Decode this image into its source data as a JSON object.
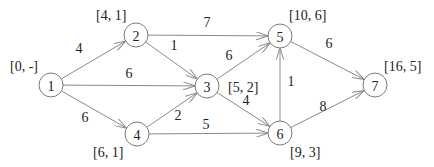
{
  "diagram": {
    "type": "directed-weighted-graph",
    "nodes": [
      {
        "id": "1",
        "x": 51,
        "y": 85,
        "tag": "[0, -]",
        "tag_x": 10,
        "tag_y": 66,
        "tag_anchor": "start"
      },
      {
        "id": "2",
        "x": 136,
        "y": 35,
        "tag": "[4, 1]",
        "tag_x": 96,
        "tag_y": 15,
        "tag_anchor": "start"
      },
      {
        "id": "3",
        "x": 207,
        "y": 86,
        "tag": "[5, 2]",
        "tag_x": 228,
        "tag_y": 87,
        "tag_anchor": "start"
      },
      {
        "id": "4",
        "x": 137,
        "y": 134,
        "tag": "[6, 1]",
        "tag_x": 93,
        "tag_y": 152,
        "tag_anchor": "start"
      },
      {
        "id": "5",
        "x": 280,
        "y": 36,
        "tag": "[10, 6]",
        "tag_x": 289,
        "tag_y": 15,
        "tag_anchor": "start"
      },
      {
        "id": "6",
        "x": 280,
        "y": 133,
        "tag": "[9, 3]",
        "tag_x": 290,
        "tag_y": 152,
        "tag_anchor": "start"
      },
      {
        "id": "7",
        "x": 375,
        "y": 85,
        "tag": "[16, 5]",
        "tag_x": 384,
        "tag_y": 66,
        "tag_anchor": "start"
      }
    ],
    "edges": [
      {
        "from": "1",
        "to": "2",
        "weight": "4",
        "lx": 79,
        "ly": 48
      },
      {
        "from": "1",
        "to": "3",
        "weight": "6",
        "lx": 129,
        "ly": 73
      },
      {
        "from": "1",
        "to": "4",
        "weight": "6",
        "lx": 85,
        "ly": 117
      },
      {
        "from": "2",
        "to": "5",
        "weight": "7",
        "lx": 207,
        "ly": 22
      },
      {
        "from": "2",
        "to": "3",
        "weight": "1",
        "lx": 174,
        "ly": 45
      },
      {
        "from": "4",
        "to": "3",
        "weight": "2",
        "lx": 178,
        "ly": 115
      },
      {
        "from": "4",
        "to": "6",
        "weight": "5",
        "lx": 206,
        "ly": 124
      },
      {
        "from": "3",
        "to": "5",
        "weight": "6",
        "lx": 229,
        "ly": 55
      },
      {
        "from": "3",
        "to": "6",
        "weight": "4",
        "lx": 246,
        "ly": 100
      },
      {
        "from": "6",
        "to": "5",
        "weight": "1",
        "lx": 291,
        "ly": 81
      },
      {
        "from": "5",
        "to": "7",
        "weight": "6",
        "lx": 329,
        "ly": 43
      },
      {
        "from": "6",
        "to": "7",
        "weight": "8",
        "lx": 323,
        "ly": 106
      }
    ],
    "node_radius": 12,
    "colors": {
      "stroke": "#7a7a7a",
      "edge": "#8a8a8a",
      "text": "#222222",
      "background": "#ffffff"
    }
  }
}
